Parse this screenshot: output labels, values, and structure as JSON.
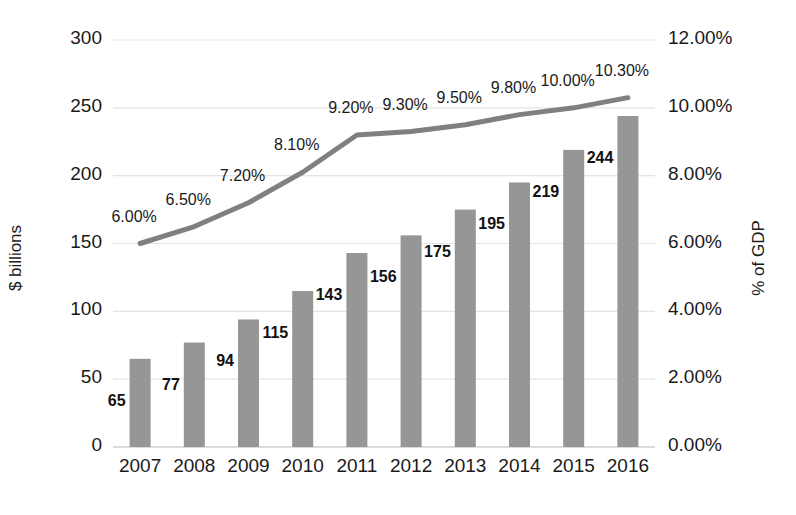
{
  "chart_data": {
    "type": "bar",
    "title": "",
    "subtitle": "",
    "categories": [
      "2007",
      "2008",
      "2009",
      "2010",
      "2011",
      "2012",
      "2013",
      "2014",
      "2015",
      "2016"
    ],
    "xlabel": "",
    "ylabel": "$ billions",
    "y2label": "% of GDP",
    "ylim": [
      0,
      300
    ],
    "y2lim": [
      0,
      12
    ],
    "yticks": [
      "0",
      "50",
      "100",
      "150",
      "200",
      "250",
      "300"
    ],
    "y2ticks": [
      "0.00%",
      "2.00%",
      "4.00%",
      "6.00%",
      "8.00%",
      "10.00%",
      "12.00%"
    ],
    "grid": true,
    "legend": "none",
    "series": [
      {
        "name": "$ billions",
        "type": "bar",
        "axis": "left",
        "color": "#969696",
        "values": [
          65,
          77,
          94,
          115,
          143,
          156,
          175,
          195,
          219,
          244
        ],
        "labels": [
          "65",
          "77",
          "94",
          "115",
          "143",
          "156",
          "175",
          "195",
          "219",
          "244"
        ]
      },
      {
        "name": "% of GDP",
        "type": "line",
        "axis": "right",
        "color": "#808080",
        "values": [
          6.0,
          6.5,
          7.2,
          8.1,
          9.2,
          9.3,
          9.5,
          9.8,
          10.0,
          10.3
        ],
        "labels": [
          "6.00%",
          "6.50%",
          "7.20%",
          "8.10%",
          "9.20%",
          "9.30%",
          "9.50%",
          "9.80%",
          "10.00%",
          "10.30%"
        ]
      }
    ]
  },
  "colors": {
    "bar": "#969696",
    "line": "#808080",
    "grid": "#e4e4e4",
    "text": "#1a1a1a"
  }
}
